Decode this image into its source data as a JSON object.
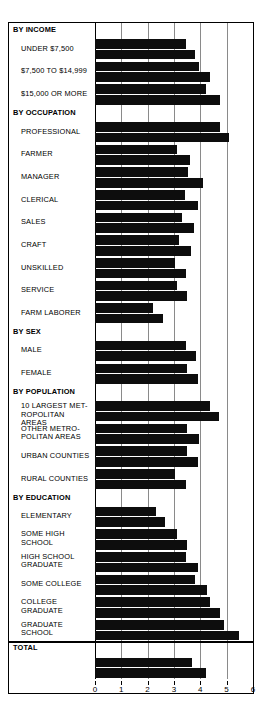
{
  "chart_data": {
    "type": "bar",
    "orientation": "horizontal",
    "title": "",
    "xlabel": "MEAN SCORE",
    "ylabel": "",
    "xlim": [
      0,
      6
    ],
    "xticks": [
      0,
      1,
      2,
      3,
      4,
      5,
      6
    ],
    "xticklabels": [
      "0",
      "1",
      "2",
      "3",
      "4",
      "5",
      "6"
    ],
    "grid": true,
    "legend": false,
    "series": [
      {
        "name": "bar-upper",
        "values": [
          3.45,
          3.95,
          4.2,
          4.75,
          3.1,
          3.55,
          3.4,
          3.3,
          3.2,
          3.05,
          2.2,
          3.1,
          3.45,
          4.35,
          3.5,
          3.5,
          3.05,
          2.3,
          3.1,
          3.45,
          3.8,
          4.35,
          4.9,
          3.7
        ]
      },
      {
        "name": "bar-lower",
        "values": [
          3.8,
          4.35,
          4.75,
          5.1,
          3.6,
          4.1,
          3.9,
          3.75,
          3.65,
          3.45,
          2.6,
          3.5,
          3.85,
          4.7,
          3.95,
          3.9,
          3.45,
          2.65,
          3.5,
          3.9,
          4.25,
          4.75,
          5.45,
          4.2
        ]
      }
    ],
    "categories": [
      "UNDER $7,500",
      "$7,500 TO $14,999",
      "$15,000 OR MORE",
      "PROFESSIONAL",
      "FARMER",
      "MANAGER",
      "CLERICAL",
      "SALES",
      "CRAFT",
      "UNSKILLED",
      "SERVICE",
      "FARM LABORER",
      "MALE",
      "FEMALE",
      "10 LARGEST METROPOLITAN AREAS",
      "OTHER METROPOLITAN AREAS",
      "URBAN COUNTIES",
      "RURAL COUNTIES",
      "ELEMENTARY",
      "SOME HIGH SCHOOL",
      "HIGH SCHOOL GRADUATE",
      "SOME COLLEGE",
      "COLLEGE GRADUATE",
      "GRADUATE SCHOOL"
    ]
  },
  "axis": {
    "label": "MEAN SCORE",
    "ticks": [
      "0",
      "1",
      "2",
      "3",
      "4",
      "5",
      "6"
    ]
  },
  "colors": {
    "bar": "#0d0d0d",
    "grid": "#8a8a8a",
    "frame": "#000000",
    "background": "#ffffff"
  },
  "rows": [
    {
      "kind": "section",
      "label": "BY INCOME"
    },
    {
      "kind": "item",
      "label": "UNDER $7,500",
      "v1": 3.45,
      "v2": 3.8
    },
    {
      "kind": "item",
      "label": "$7,500 TO $14,999",
      "v1": 3.95,
      "v2": 4.35
    },
    {
      "kind": "item",
      "label": "$15,000 OR MORE",
      "v1": 4.2,
      "v2": 4.75
    },
    {
      "kind": "section",
      "label": "BY OCCUPATION"
    },
    {
      "kind": "item",
      "label": "PROFESSIONAL",
      "v1": 4.75,
      "v2": 5.1
    },
    {
      "kind": "item",
      "label": "FARMER",
      "v1": 3.1,
      "v2": 3.6
    },
    {
      "kind": "item",
      "label": "MANAGER",
      "v1": 3.55,
      "v2": 4.1
    },
    {
      "kind": "item",
      "label": "CLERICAL",
      "v1": 3.4,
      "v2": 3.9
    },
    {
      "kind": "item",
      "label": "SALES",
      "v1": 3.3,
      "v2": 3.75
    },
    {
      "kind": "item",
      "label": "CRAFT",
      "v1": 3.2,
      "v2": 3.65
    },
    {
      "kind": "item",
      "label": "UNSKILLED",
      "v1": 3.05,
      "v2": 3.45
    },
    {
      "kind": "item",
      "label": "SERVICE",
      "v1": 3.1,
      "v2": 3.5
    },
    {
      "kind": "item",
      "label": "FARM LABORER",
      "v1": 2.2,
      "v2": 2.6
    },
    {
      "kind": "section",
      "label": "BY SEX"
    },
    {
      "kind": "item",
      "label": "MALE",
      "v1": 3.45,
      "v2": 3.85
    },
    {
      "kind": "item",
      "label": "FEMALE",
      "v1": 3.5,
      "v2": 3.9
    },
    {
      "kind": "section",
      "label": "BY POPULATION"
    },
    {
      "kind": "item",
      "label": "10 LARGEST MET-\nROPOLITAN AREAS",
      "v1": 4.35,
      "v2": 4.7,
      "tight": true
    },
    {
      "kind": "item",
      "label": "OTHER METRO-\nPOLITAN AREAS",
      "v1": 3.5,
      "v2": 3.95
    },
    {
      "kind": "item",
      "label": "URBAN COUNTIES",
      "v1": 3.5,
      "v2": 3.9
    },
    {
      "kind": "item",
      "label": "RURAL COUNTIES",
      "v1": 3.05,
      "v2": 3.45
    },
    {
      "kind": "section",
      "label": "BY EDUCATION"
    },
    {
      "kind": "item",
      "label": "ELEMENTARY",
      "v1": 2.3,
      "v2": 2.65
    },
    {
      "kind": "item",
      "label": "SOME HIGH\nSCHOOL",
      "v1": 3.1,
      "v2": 3.5
    },
    {
      "kind": "item",
      "label": "HIGH SCHOOL\nGRADUATE",
      "v1": 3.45,
      "v2": 3.9
    },
    {
      "kind": "item",
      "label": "SOME COLLEGE",
      "v1": 3.8,
      "v2": 4.25
    },
    {
      "kind": "item",
      "label": "COLLEGE\nGRADUATE",
      "v1": 4.35,
      "v2": 4.75
    },
    {
      "kind": "item",
      "label": "GRADUATE\nSCHOOL",
      "v1": 4.9,
      "v2": 5.45
    },
    {
      "kind": "section",
      "label": "TOTAL",
      "rule": true
    },
    {
      "kind": "item",
      "label": "",
      "v1": 3.7,
      "v2": 4.2,
      "noLabel": true
    }
  ]
}
